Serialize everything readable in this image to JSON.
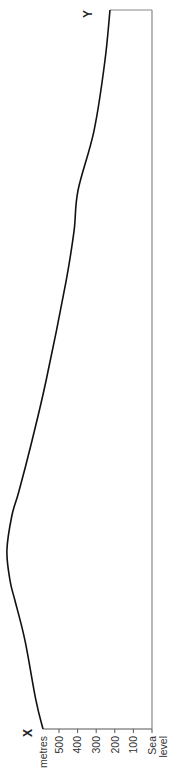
{
  "chart_data": {
    "type": "line",
    "title": "",
    "orientation": "rotated-90-ccw",
    "start_label": "X",
    "end_label": "Y",
    "ylabel": "metres",
    "xlabel": "",
    "y_ticks": [
      {
        "value": 500,
        "label": "500"
      },
      {
        "value": 400,
        "label": "400"
      },
      {
        "value": 300,
        "label": "300"
      },
      {
        "value": 200,
        "label": "200"
      },
      {
        "value": 100,
        "label": "100"
      }
    ],
    "baseline_label_line1": "Sea",
    "baseline_label_line2": "level",
    "ylim": [
      0,
      800
    ],
    "grid": false,
    "series": [
      {
        "name": "Cross-section profile X to Y",
        "distance_fraction": [
          0.0,
          0.04,
          0.123,
          0.179,
          0.206,
          0.248,
          0.297,
          0.331,
          0.401,
          0.484,
          0.623,
          0.693,
          0.749,
          0.832,
          0.929,
          1.0
        ],
        "elevation_m": [
          586,
          624,
          683,
          737,
          763,
          780,
          753,
          715,
          645,
          570,
          462,
          419,
          398,
          312,
          253,
          226
        ]
      }
    ],
    "colors": {
      "profile": "#111111",
      "frame": "#888888",
      "axis": "#555555",
      "text": "#333333"
    }
  }
}
